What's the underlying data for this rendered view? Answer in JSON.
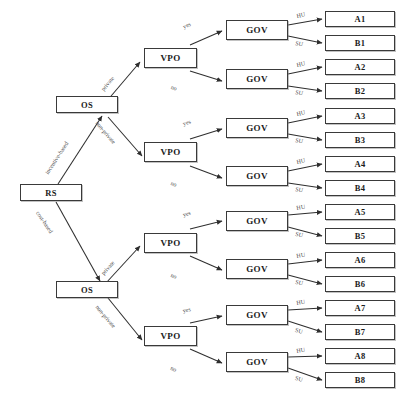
{
  "diagram": {
    "root": {
      "id": "RS",
      "label": "RS"
    },
    "level1": [
      {
        "id": "OS-top",
        "label": "OS"
      },
      {
        "id": "OS-bottom",
        "label": "OS"
      }
    ],
    "level2": [
      {
        "id": "VPO-1",
        "label": "VPO"
      },
      {
        "id": "VPO-2",
        "label": "VPO"
      },
      {
        "id": "VPO-3",
        "label": "VPO"
      },
      {
        "id": "VPO-4",
        "label": "VPO"
      }
    ],
    "level3": [
      {
        "id": "GOV-1",
        "label": "GOV"
      },
      {
        "id": "GOV-2",
        "label": "GOV"
      },
      {
        "id": "GOV-3",
        "label": "GOV"
      },
      {
        "id": "GOV-4",
        "label": "GOV"
      },
      {
        "id": "GOV-5",
        "label": "GOV"
      },
      {
        "id": "GOV-6",
        "label": "GOV"
      },
      {
        "id": "GOV-7",
        "label": "GOV"
      },
      {
        "id": "GOV-8",
        "label": "GOV"
      }
    ],
    "leaves": [
      {
        "id": "A1",
        "label": "A1"
      },
      {
        "id": "B1",
        "label": "B1"
      },
      {
        "id": "A2",
        "label": "A2"
      },
      {
        "id": "B2",
        "label": "B2"
      },
      {
        "id": "A3",
        "label": "A3"
      },
      {
        "id": "B3",
        "label": "B3"
      },
      {
        "id": "A4",
        "label": "A4"
      },
      {
        "id": "B4",
        "label": "B4"
      },
      {
        "id": "A5",
        "label": "A5"
      },
      {
        "id": "B5",
        "label": "B5"
      },
      {
        "id": "A6",
        "label": "A6"
      },
      {
        "id": "B6",
        "label": "B6"
      },
      {
        "id": "A7",
        "label": "A7"
      },
      {
        "id": "B7",
        "label": "B7"
      },
      {
        "id": "A8",
        "label": "A8"
      },
      {
        "id": "B8",
        "label": "B8"
      }
    ],
    "edge_labels": {
      "root_to_os": [
        "incentive-based",
        "cost-based"
      ],
      "os_to_vpo": [
        "private",
        "non-private",
        "private",
        "non-private"
      ],
      "vpo_to_gov": [
        "yes",
        "no",
        "yes",
        "no",
        "yes",
        "no",
        "yes",
        "no"
      ],
      "gov_to_leaf": [
        "HU",
        "SU",
        "HU",
        "SU",
        "HU",
        "SU",
        "HU",
        "SU",
        "HU",
        "SU",
        "HU",
        "SU",
        "HU",
        "SU",
        "HU",
        "SU"
      ]
    },
    "colors": {
      "box_border": "#3a3a3a",
      "box_fill": "#ffffff",
      "edge": "#2e2e2e",
      "label_text": "#4a4a4a",
      "node_text": "#1a1a1a"
    }
  }
}
